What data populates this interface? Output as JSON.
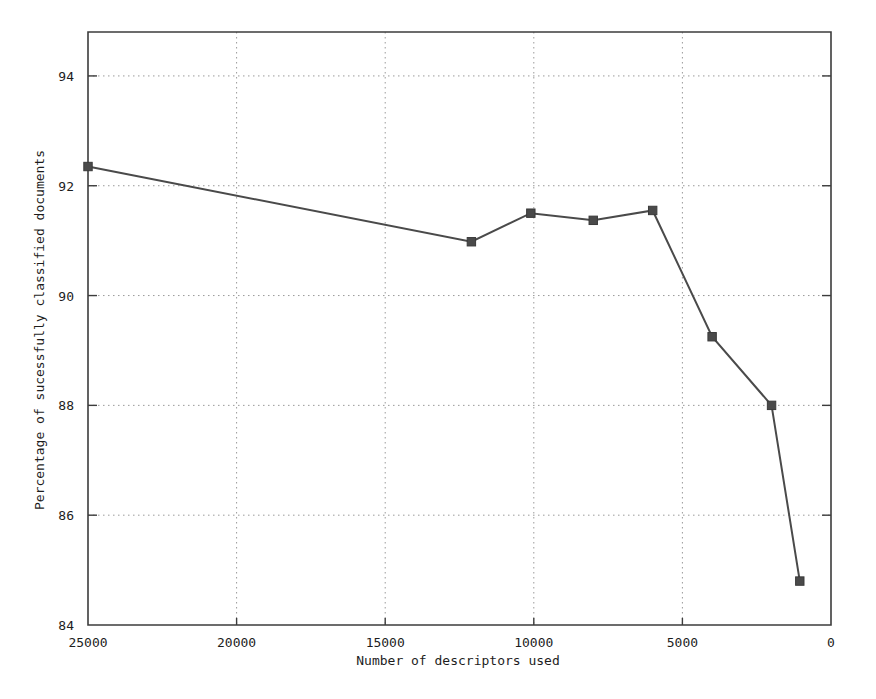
{
  "chart_data": {
    "type": "line",
    "title": "",
    "xlabel": "Number of descriptors used",
    "ylabel": "Percentage of sucessfully classified documents",
    "xlim": [
      25000,
      0
    ],
    "ylim": [
      84,
      94.8
    ],
    "x_reversed": true,
    "grid": true,
    "legend": "none",
    "xticks": [
      25000,
      20000,
      15000,
      10000,
      5000,
      0
    ],
    "xtick_labels": [
      "25000",
      "20000",
      "15000",
      "10000",
      "5000",
      "0"
    ],
    "yticks": [
      84,
      86,
      88,
      90,
      92,
      94
    ],
    "ytick_labels": [
      "84",
      "86",
      "88",
      "90",
      "92",
      "94"
    ],
    "series": [
      {
        "name": "classification accuracy",
        "marker": "square",
        "color": "#4a4a4a",
        "x": [
          25000,
          12100,
          10100,
          8000,
          6000,
          4000,
          2000,
          1050
        ],
        "y": [
          92.35,
          90.98,
          91.5,
          91.37,
          91.55,
          89.25,
          88.0,
          84.8
        ]
      }
    ]
  },
  "axes": {
    "x_title": "Number of descriptors used",
    "y_title": "Percentage of sucessfully classified documents"
  }
}
